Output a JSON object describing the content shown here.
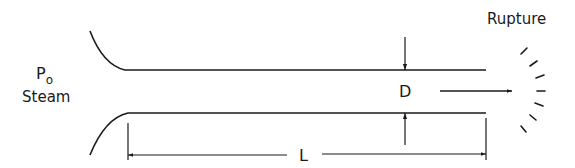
{
  "diagram": {
    "inlet_label": {
      "symbol": "P",
      "subscript": "o",
      "medium": "Steam"
    },
    "diameter_label": "D",
    "length_label": "L",
    "outlet_label": "Rupture"
  },
  "colors": {
    "stroke": "#1a1a1a",
    "background": "#ffffff"
  }
}
